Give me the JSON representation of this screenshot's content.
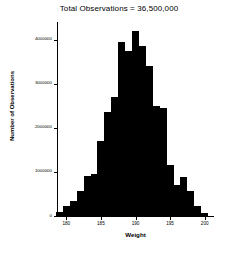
{
  "chart_data": {
    "type": "bar",
    "title": "Total Observations = 36,500,000",
    "xlabel": "Weight",
    "ylabel": "Number of Observations",
    "xlim": [
      178.8,
      201.2
    ],
    "ylim": [
      0,
      4400000
    ],
    "grid": false,
    "legend": null,
    "bin_width": 1,
    "xticks": [
      180,
      185,
      190,
      195,
      200
    ],
    "xtick_labels": [
      "180",
      "185",
      "190",
      "195",
      "200"
    ],
    "yticks": [
      0,
      1000000,
      2000000,
      3000000,
      4000000
    ],
    "ytick_labels": [
      "0",
      "1000000",
      "2000000",
      "3000000",
      "4000000"
    ],
    "categories": [
      "179",
      "180",
      "181",
      "182",
      "183",
      "184",
      "185",
      "186",
      "187",
      "188",
      "189",
      "190",
      "191",
      "192",
      "193",
      "194",
      "195",
      "196",
      "197",
      "198",
      "199",
      "200"
    ],
    "x": [
      179,
      180,
      181,
      182,
      183,
      184,
      185,
      186,
      187,
      188,
      189,
      190,
      191,
      192,
      193,
      194,
      195,
      196,
      197,
      198,
      199,
      200
    ],
    "values": [
      100000,
      220000,
      330000,
      560000,
      900000,
      960000,
      1700000,
      2350000,
      2700000,
      3950000,
      3750000,
      4200000,
      3850000,
      3400000,
      2500000,
      2450000,
      1150000,
      700000,
      880000,
      560000,
      230000,
      60000
    ],
    "bar_color": "#000000",
    "background_color": "#ffffff"
  },
  "figure": {
    "title": "Total Observations = 36,500,000",
    "axis_color": "#000000"
  }
}
